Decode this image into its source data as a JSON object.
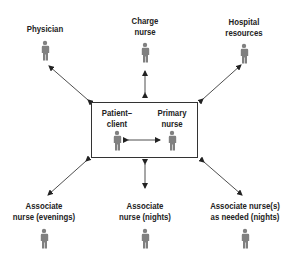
{
  "diagram": {
    "center": {
      "left_label": "Patient–\nclient",
      "left_line1": "Patient–",
      "left_line2": "client",
      "right_line1": "Primary",
      "right_line2": "nurse"
    },
    "nodes": [
      {
        "id": "physician",
        "line1": "Physician",
        "line2": ""
      },
      {
        "id": "charge-nurse",
        "line1": "Charge",
        "line2": "nurse"
      },
      {
        "id": "hospital-resources",
        "line1": "Hospital",
        "line2": "resources"
      },
      {
        "id": "associate-evenings",
        "line1": "Associate",
        "line2": "nurse (evenings)"
      },
      {
        "id": "associate-nights",
        "line1": "Associate",
        "line2": "nurse (nights)"
      },
      {
        "id": "associate-as-needed",
        "line1": "Associate nurse(s)",
        "line2": "as needed (nights)"
      }
    ],
    "colors": {
      "figure": "#808080",
      "line": "#222222",
      "text": "#222222"
    }
  }
}
